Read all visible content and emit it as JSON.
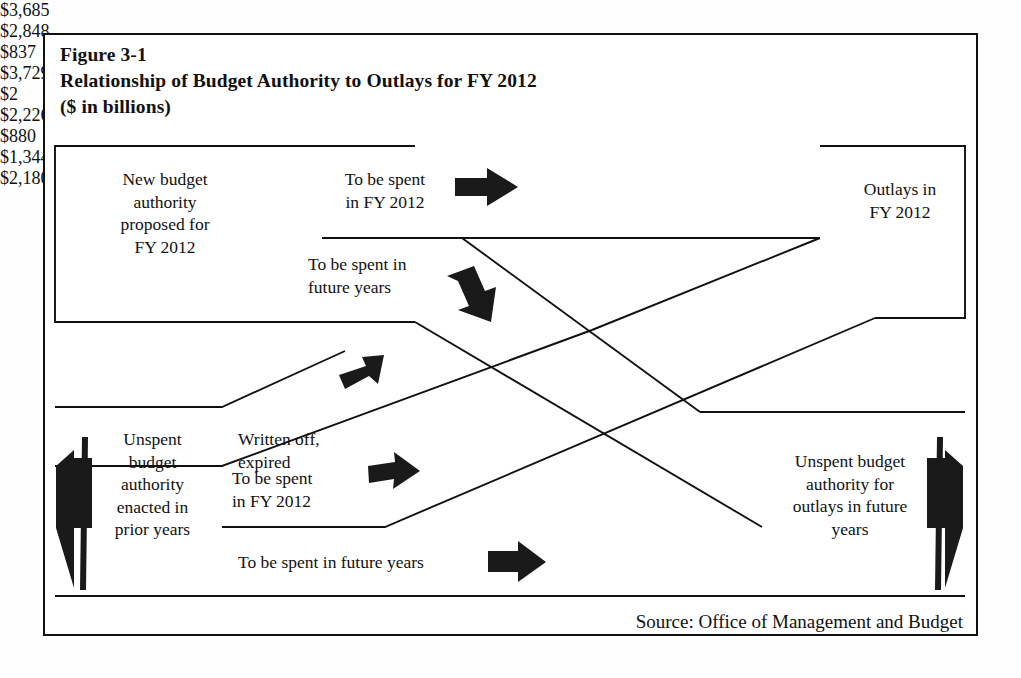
{
  "figure": {
    "number": "Figure 3-1",
    "title": "Relationship of Budget Authority to Outlays for FY 2012",
    "units": "($ in billions)",
    "source": "Source:  Office of Management and Budget"
  },
  "nodes": {
    "new_budget_authority": {
      "label": "New budget\nauthority\nproposed for\nFY 2012",
      "amount": "$3,685"
    },
    "outlays": {
      "label": "Outlays in\nFY 2012",
      "amount": "$3,729"
    },
    "unspent_prior": {
      "label": "Unspent\nbudget\nauthority\nenacted in\nprior years",
      "amount": "$2,226"
    },
    "unspent_future": {
      "label": "Unspent budget\nauthority for\noutlays in future\nyears",
      "amount": "$2,180"
    }
  },
  "flows": [
    {
      "id": "new-to-outlays",
      "label": "To be spent\nin FY 2012",
      "amount": "$2,848"
    },
    {
      "id": "new-to-future",
      "label": "To be spent in\nfuture years",
      "amount": "$837"
    },
    {
      "id": "written-off",
      "label": "Written off,\nexpired",
      "amount": "$2"
    },
    {
      "id": "prior-to-outlays",
      "label": "To be spent\nin FY 2012",
      "amount": "$880"
    },
    {
      "id": "prior-to-future",
      "label": "To be spent in future years",
      "amount": "$1,344"
    }
  ],
  "colors": {
    "ink": "#111111",
    "arrow": "#1a1a1a",
    "background": "#ffffff"
  },
  "icons": {
    "arrow_right": "arrow-right-icon",
    "arrow_down_right": "arrow-down-right-icon",
    "arrow_left_block": "arrow-left-block-icon",
    "arrow_right_block": "arrow-right-block-icon"
  },
  "chart_data": {
    "type": "diagram",
    "title": "Relationship of Budget Authority to Outlays for FY 2012",
    "units": "billions of dollars",
    "sources": [
      {
        "name": "New budget authority proposed for FY 2012",
        "value": 3685
      },
      {
        "name": "Unspent budget authority enacted in prior years",
        "value": 2226
      }
    ],
    "sinks": [
      {
        "name": "Outlays in FY 2012",
        "value": 3729
      },
      {
        "name": "Unspent budget authority for outlays in future years",
        "value": 2180
      }
    ],
    "links": [
      {
        "from": "New budget authority proposed for FY 2012",
        "to": "Outlays in FY 2012",
        "label": "To be spent in FY 2012",
        "value": 2848
      },
      {
        "from": "New budget authority proposed for FY 2012",
        "to": "Unspent budget authority for outlays in future years",
        "label": "To be spent in future years",
        "value": 837
      },
      {
        "from": "Unspent budget authority enacted in prior years",
        "to": "Written off, expired",
        "label": "Written off, expired",
        "value": 2
      },
      {
        "from": "Unspent budget authority enacted in prior years",
        "to": "Outlays in FY 2012",
        "label": "To be spent in FY 2012",
        "value": 880
      },
      {
        "from": "Unspent budget authority enacted in prior years",
        "to": "Unspent budget authority for outlays in future years",
        "label": "To be spent in future years",
        "value": 1344
      }
    ]
  }
}
